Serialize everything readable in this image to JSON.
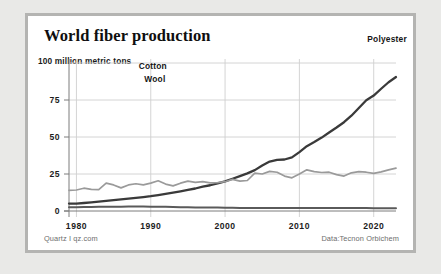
{
  "card": {
    "title": "World fiber production",
    "y_unit_label": "100 million metric tons",
    "credit_left": "Quartz I qz.com",
    "credit_right": "Data:Tecnon Orbichem",
    "border_color": "#b4b4b2",
    "background_color": "#ffffff",
    "page_background": "#e9e9e7"
  },
  "chart_data": {
    "type": "line",
    "title": "World fiber production",
    "subtitle": "",
    "xlabel": "",
    "ylabel": "100 million metric tons",
    "xlim": [
      1979,
      2023
    ],
    "ylim": [
      0,
      100
    ],
    "xticks": [
      1980,
      1990,
      2000,
      2010,
      2020
    ],
    "xtick_labels": [
      "1980",
      "1990",
      "2000",
      "2010",
      "2020"
    ],
    "yticks": [
      0,
      25,
      50,
      75,
      100
    ],
    "ytick_labels": [
      "0",
      "25",
      "50",
      "75",
      "100 million metric tons"
    ],
    "grid": true,
    "legend": "inline-labels",
    "x": [
      1979,
      1980,
      1981,
      1982,
      1983,
      1984,
      1985,
      1986,
      1987,
      1988,
      1989,
      1990,
      1991,
      1992,
      1993,
      1994,
      1995,
      1996,
      1997,
      1998,
      1999,
      2000,
      2001,
      2002,
      2003,
      2004,
      2005,
      2006,
      2007,
      2008,
      2009,
      2010,
      2011,
      2012,
      2013,
      2014,
      2015,
      2016,
      2017,
      2018,
      2019,
      2020,
      2021,
      2022,
      2023
    ],
    "series": [
      {
        "name": "Polyester",
        "color": "#3a3a3a",
        "label_color": "#151515",
        "values": [
          5.0,
          5.0,
          5.4,
          5.8,
          6.3,
          6.8,
          7.3,
          7.8,
          8.3,
          8.8,
          9.4,
          10.0,
          10.8,
          11.6,
          12.4,
          13.3,
          14.2,
          15.2,
          16.4,
          17.4,
          18.6,
          20.0,
          21.8,
          23.6,
          25.4,
          27.6,
          30.8,
          33.4,
          34.6,
          34.8,
          36.2,
          39.8,
          43.8,
          46.6,
          49.6,
          53.0,
          56.4,
          60.0,
          64.4,
          69.6,
          74.8,
          78.0,
          82.6,
          87.0,
          90.5
        ]
      },
      {
        "name": "Cotton",
        "color": "#9a9a9a",
        "label_color": "#151515",
        "values": [
          14.0,
          14.2,
          15.4,
          14.6,
          14.4,
          18.8,
          17.6,
          15.6,
          17.6,
          18.4,
          17.6,
          18.8,
          20.4,
          18.2,
          17.0,
          18.8,
          20.2,
          19.4,
          19.8,
          19.0,
          19.2,
          19.8,
          21.4,
          20.2,
          20.6,
          25.6,
          25.0,
          26.8,
          26.2,
          23.6,
          22.4,
          25.0,
          27.8,
          26.6,
          26.0,
          26.2,
          24.6,
          23.6,
          25.8,
          26.6,
          26.2,
          25.4,
          26.4,
          27.8,
          29.0
        ]
      },
      {
        "name": "Wool",
        "color": "#5a5a5a",
        "label_color": "#151515",
        "values": [
          2.6,
          2.6,
          2.7,
          2.7,
          2.8,
          2.8,
          2.9,
          2.9,
          3.0,
          3.0,
          3.0,
          2.9,
          2.9,
          2.8,
          2.7,
          2.6,
          2.5,
          2.4,
          2.4,
          2.3,
          2.3,
          2.2,
          2.2,
          2.1,
          2.1,
          2.1,
          2.1,
          2.1,
          2.1,
          2.0,
          2.0,
          2.0,
          2.0,
          2.0,
          2.0,
          2.0,
          2.0,
          2.0,
          2.0,
          2.0,
          2.0,
          1.9,
          1.9,
          1.9,
          1.9
        ]
      }
    ],
    "series_label_positions": [
      {
        "name": "Polyester",
        "x": 1018,
        "y": 78
      },
      {
        "name": "Cotton",
        "x": 332,
        "y": 159
      },
      {
        "name": "Wool",
        "x": 349,
        "y": 198
      }
    ]
  }
}
